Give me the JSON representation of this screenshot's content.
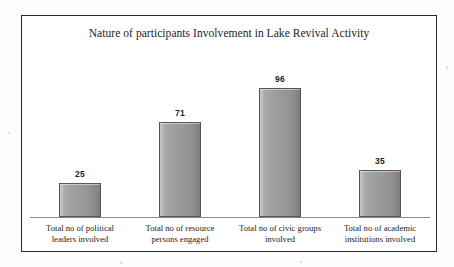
{
  "chart_data": {
    "type": "bar",
    "title": "Nature of participants Involvement in Lake Revival Activity",
    "xlabel": "",
    "ylabel": "",
    "ylim": [
      0,
      110
    ],
    "grid": false,
    "legend": false,
    "axis_line": true,
    "bar_color": "#9b9b9b",
    "bar_border_color": "#575757",
    "frame_color": "#2b2b2b",
    "background_color": "#ffffff",
    "categories": [
      "Total no of political leaders involved",
      "Total no of resource persons engaged",
      "Total no of civic groups involved",
      "Total no of academic institutions involved"
    ],
    "category_lines": [
      [
        "Total no of political",
        "leaders involved"
      ],
      [
        "Total no of resource",
        "persons engaged"
      ],
      [
        "Total no of civic groups",
        "involved"
      ],
      [
        "Total no of academic",
        "institutions involved"
      ]
    ],
    "values": [
      25,
      71,
      96,
      35
    ],
    "value_labels": [
      "25",
      "71",
      "96",
      "35"
    ],
    "bars": [
      {
        "label": "Total no of political leaders involved",
        "value": 25,
        "value_label": "25"
      },
      {
        "label": "Total no of resource persons engaged",
        "value": 71,
        "value_label": "71"
      },
      {
        "label": "Total no of civic groups involved",
        "value": 96,
        "value_label": "96"
      },
      {
        "label": "Total no of academic institutions involved",
        "value": 35,
        "value_label": "35"
      }
    ]
  }
}
